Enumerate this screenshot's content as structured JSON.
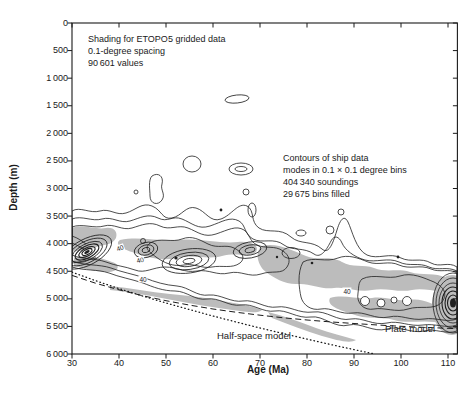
{
  "colors": {
    "background": "#ffffff",
    "ink": "#1a1a1a",
    "shading_gray": "#bcbcbc"
  },
  "chart_data": {
    "type": "contour",
    "title": "",
    "xlabel": "Age (Ma)",
    "ylabel": "Depth (m)",
    "xlim": [
      30,
      112
    ],
    "ylim": [
      0,
      6000
    ],
    "y_axis_inverted": true,
    "grid": false,
    "x_ticks": [
      30,
      40,
      50,
      60,
      70,
      80,
      90,
      100,
      110
    ],
    "x_tick_labels": [
      "30",
      "40",
      "50",
      "60",
      "70",
      "80",
      "90",
      "100",
      "110"
    ],
    "y_ticks": [
      0,
      500,
      1000,
      1500,
      2000,
      2500,
      3000,
      3500,
      4000,
      4500,
      5000,
      5500,
      6000
    ],
    "y_tick_labels": [
      "0",
      "500",
      "1 000",
      "1 500",
      "2 000",
      "2 500",
      "3 000",
      "3 500",
      "4 000",
      "4 500",
      "5 000",
      "5 500",
      "6 000"
    ],
    "annotations": {
      "shading_note": [
        "Shading for ETOPO5 gridded data",
        "0.1-degree spacing",
        "90 601 values"
      ],
      "contours_note": [
        "Contours of ship data",
        "modes in 0.1 × 0.1 degree bins",
        "404 340 soundings",
        "29 675 bins filled"
      ],
      "contour_level_label": "40"
    },
    "contour_band_ridge": {
      "description": "Depths of greatest concentration of ship-sounding modes (band deepens with age)",
      "points": [
        [
          30,
          4200
        ],
        [
          40,
          4300
        ],
        [
          50,
          4450
        ],
        [
          60,
          4600
        ],
        [
          70,
          4700
        ],
        [
          80,
          4850
        ],
        [
          90,
          4950
        ],
        [
          100,
          5050
        ],
        [
          110,
          5150
        ]
      ]
    },
    "series": [
      {
        "name": "Half-space model",
        "style": "dotted",
        "points": [
          [
            30,
            4517
          ],
          [
            35,
            4671
          ],
          [
            40,
            4814
          ],
          [
            45,
            4948
          ],
          [
            50,
            5075
          ],
          [
            55,
            5196
          ],
          [
            60,
            5311
          ],
          [
            65,
            5422
          ],
          [
            70,
            5528
          ],
          [
            75,
            5631
          ],
          [
            80,
            5730
          ],
          [
            85,
            5827
          ],
          [
            90,
            5920
          ],
          [
            94.4,
            6000
          ]
        ]
      },
      {
        "name": "Plate model",
        "style": "dashed",
        "points": [
          [
            30,
            4576
          ],
          [
            35,
            4716
          ],
          [
            40,
            4837
          ],
          [
            45,
            4943
          ],
          [
            50,
            5034
          ],
          [
            55,
            5114
          ],
          [
            60,
            5184
          ],
          [
            65,
            5244
          ],
          [
            70,
            5297
          ],
          [
            75,
            5343
          ],
          [
            80,
            5383
          ],
          [
            85,
            5418
          ],
          [
            90,
            5448
          ],
          [
            95,
            5474
          ],
          [
            100,
            5497
          ],
          [
            105,
            5517
          ],
          [
            110,
            5535
          ],
          [
            112,
            5541
          ]
        ]
      }
    ]
  }
}
